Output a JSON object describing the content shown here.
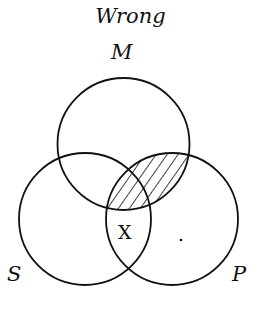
{
  "title": "Wrong",
  "circles": {
    "m": {
      "label": "M"
    },
    "s": {
      "label": "S"
    },
    "p": {
      "label": "P"
    }
  },
  "marks": {
    "x": "X",
    "dot": "."
  },
  "shaded_region": "M ∩ P",
  "colors": {
    "stroke": "#111111",
    "background": "#ffffff"
  }
}
